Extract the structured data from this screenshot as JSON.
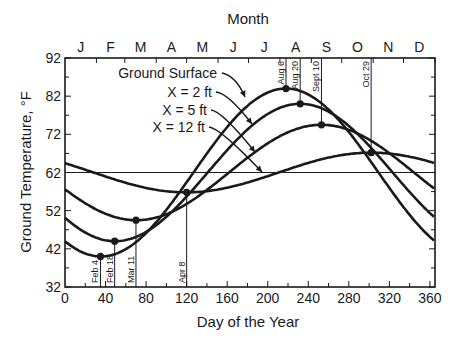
{
  "chart_data": {
    "type": "line",
    "title": "",
    "top_axis_label": "Month",
    "month_labels": [
      "J",
      "F",
      "M",
      "A",
      "M",
      "J",
      "J",
      "A",
      "S",
      "O",
      "N",
      "D"
    ],
    "xlabel": "Day of the Year",
    "ylabel": "Ground Temperature, °F",
    "xlim": [
      0,
      365
    ],
    "ylim": [
      32,
      92
    ],
    "xticks": [
      0,
      40,
      80,
      120,
      160,
      200,
      240,
      280,
      320,
      360
    ],
    "yticks": [
      32,
      42,
      52,
      62,
      72,
      82,
      92
    ],
    "grid": false,
    "reference_line": {
      "y": 62
    },
    "model": "T(t) = mean + amplitude * cos(2*pi*(t - peak_day)/365)",
    "series": [
      {
        "name": "Ground Surface",
        "mean": 62,
        "amplitude": 22,
        "peak_day": 218,
        "x": [
          0,
          35,
          60,
          90,
          120,
          150,
          180,
          218,
          250,
          280,
          300,
          330,
          365
        ],
        "values": [
          44,
          40,
          41.5,
          47,
          55,
          65,
          75,
          84,
          80.5,
          72,
          64.5,
          52,
          44
        ],
        "min": {
          "day": 35,
          "temp": 40,
          "label": "Feb 4"
        },
        "max": {
          "day": 218,
          "temp": 84,
          "label": "Aug 6"
        }
      },
      {
        "name": "X = 2 ft",
        "mean": 62,
        "amplitude": 18,
        "peak_day": 232,
        "x": [
          0,
          49,
          80,
          120,
          160,
          200,
          232,
          260,
          290,
          320,
          365
        ],
        "values": [
          50,
          44,
          46,
          52.5,
          63,
          73,
          80,
          78,
          71,
          60.5,
          50
        ],
        "min": {
          "day": 49,
          "temp": 44,
          "label": "Feb 18"
        },
        "max": {
          "day": 232,
          "temp": 80,
          "label": "Aug 20"
        }
      },
      {
        "name": "X = 5 ft",
        "mean": 62,
        "amplitude": 12.5,
        "peak_day": 253,
        "x": [
          0,
          70,
          100,
          140,
          180,
          220,
          253,
          290,
          320,
          365
        ],
        "values": [
          57.5,
          49.5,
          51,
          56.5,
          64,
          71.5,
          74.5,
          72,
          66.5,
          57.5
        ],
        "min": {
          "day": 70,
          "temp": 49.5,
          "label": "Mar 11"
        },
        "max": {
          "day": 253,
          "temp": 74.5,
          "label": "Sept 10"
        }
      },
      {
        "name": "X = 12 ft",
        "mean": 62,
        "amplitude": 5.2,
        "peak_day": 302,
        "x": [
          0,
          60,
          98,
          120,
          160,
          200,
          240,
          302,
          340,
          365
        ],
        "values": [
          64.5,
          59,
          57.5,
          57,
          58,
          61,
          64,
          67,
          66,
          64.5
        ],
        "min": {
          "day": 120,
          "temp": 57,
          "label": "Apr 8"
        },
        "max": {
          "day": 302,
          "temp": 67,
          "label": "Oct 29"
        }
      }
    ],
    "annotations": [
      {
        "text": "Feb 4",
        "day": 35
      },
      {
        "text": "Feb 18",
        "day": 49
      },
      {
        "text": "Mar 11",
        "day": 70
      },
      {
        "text": "Apr 8",
        "day": 120
      },
      {
        "text": "Aug 6",
        "day": 218
      },
      {
        "text": "Aug 20",
        "day": 232
      },
      {
        "text": "Sept 10",
        "day": 253
      },
      {
        "text": "Oct 29",
        "day": 302
      }
    ],
    "legend": {
      "position": "inline-arrows",
      "entries": [
        "Ground Surface",
        "X = 2 ft",
        "X = 5 ft",
        "X = 12 ft"
      ]
    }
  }
}
